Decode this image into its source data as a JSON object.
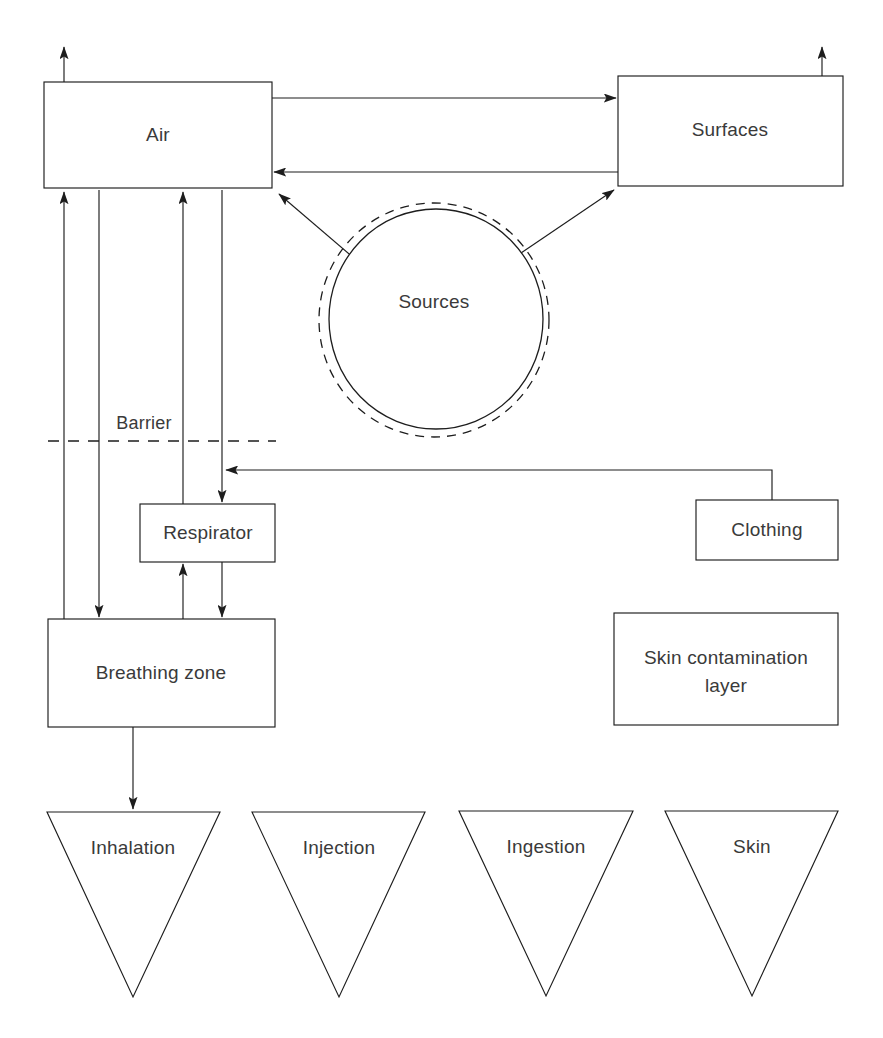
{
  "diagram": {
    "stroke_color": "#1d1d1d",
    "text_color": "#3a3a3a",
    "background": "#ffffff",
    "nodes": {
      "air": {
        "label": "Air",
        "shape": "rectangle"
      },
      "surfaces": {
        "label": "Surfaces",
        "shape": "rectangle"
      },
      "sources": {
        "label": "Sources",
        "shape": "double-circle"
      },
      "barrier": {
        "label": "Barrier",
        "shape": "dashed-line"
      },
      "respirator": {
        "label": "Respirator",
        "shape": "rectangle"
      },
      "clothing": {
        "label": "Clothing",
        "shape": "rectangle"
      },
      "breathing_zone": {
        "label": "Breathing zone",
        "shape": "rectangle"
      },
      "skin_contamination": {
        "label_line1": "Skin contamination",
        "label_line2": "layer",
        "shape": "rectangle"
      },
      "inhalation": {
        "label": "Inhalation",
        "shape": "inverted-triangle"
      },
      "injection": {
        "label": "Injection",
        "shape": "inverted-triangle"
      },
      "ingestion": {
        "label": "Ingestion",
        "shape": "inverted-triangle"
      },
      "skin": {
        "label": "Skin",
        "shape": "inverted-triangle"
      }
    },
    "edges": [
      {
        "name": "air-exhaust-up",
        "from": "air",
        "to": "outside",
        "style": "solid-arrow"
      },
      {
        "name": "surfaces-exhaust-up",
        "from": "surfaces",
        "to": "outside",
        "style": "solid-arrow"
      },
      {
        "name": "air-to-surfaces",
        "from": "air",
        "to": "surfaces",
        "style": "solid-arrow"
      },
      {
        "name": "surfaces-to-air",
        "from": "surfaces",
        "to": "air",
        "style": "solid-arrow"
      },
      {
        "name": "sources-to-air",
        "from": "sources",
        "to": "air",
        "style": "solid-arrow"
      },
      {
        "name": "sources-to-surfaces",
        "from": "sources",
        "to": "surfaces",
        "style": "solid-arrow"
      },
      {
        "name": "breathing-zone-to-air",
        "from": "breathing-zone",
        "to": "air",
        "style": "solid-arrow"
      },
      {
        "name": "air-to-breathing-zone",
        "from": "air",
        "to": "breathing-zone",
        "style": "solid-arrow"
      },
      {
        "name": "respirator-to-air",
        "from": "respirator",
        "to": "air",
        "style": "solid-arrow"
      },
      {
        "name": "air-to-respirator",
        "from": "air",
        "to": "respirator",
        "style": "solid-arrow"
      },
      {
        "name": "breathing-zone-to-respirator",
        "from": "breathing-zone",
        "to": "respirator",
        "style": "solid-arrow"
      },
      {
        "name": "respirator-to-breathing-zone",
        "from": "respirator",
        "to": "breathing-zone",
        "style": "solid-arrow"
      },
      {
        "name": "clothing-to-respirator-path",
        "from": "clothing",
        "to": "air-respirator-line",
        "style": "solid-arrow"
      },
      {
        "name": "breathing-zone-to-inhalation",
        "from": "breathing-zone",
        "to": "inhalation",
        "style": "solid-arrow"
      }
    ]
  }
}
